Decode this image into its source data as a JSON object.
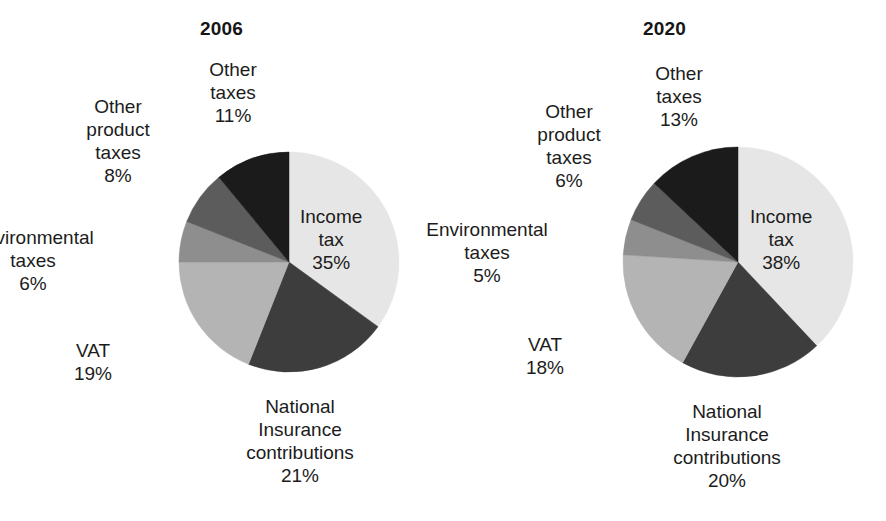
{
  "figure": {
    "background": "#ffffff",
    "text_color": "#1c1c1c"
  },
  "palette": {
    "income_tax": "#e6e6e6",
    "national_insurance": "#3d3d3d",
    "vat": "#b4b4b4",
    "environmental_taxes": "#8e8e8e",
    "other_product_taxes": "#5c5c5c",
    "other_taxes": "#1b1b1b"
  },
  "charts": [
    {
      "id": "pie-2006",
      "title": "2006",
      "center": {
        "x": 289,
        "y": 262
      },
      "radius": 110,
      "start_angle_deg": 0,
      "direction": "clockwise",
      "slices": [
        {
          "key": "income_tax",
          "name": "Income tax",
          "value": 35,
          "value_label": "35%",
          "color": "#e6e6e6",
          "label_lines": [
            "Income",
            "tax",
            "35%"
          ],
          "label_x": 300,
          "label_y": 205,
          "label_align": "left",
          "placement": "inside"
        },
        {
          "key": "national_insurance",
          "name": "National Insurance contributions",
          "value": 21,
          "value_label": "21%",
          "color": "#3d3d3d",
          "label_lines": [
            "National",
            "Insurance",
            "contributions",
            "21%"
          ],
          "label_x": 300,
          "label_y": 395,
          "label_align": "center",
          "placement": "outside"
        },
        {
          "key": "vat",
          "name": "VAT",
          "value": 19,
          "value_label": "19%",
          "color": "#b4b4b4",
          "label_lines": [
            "VAT",
            "19%"
          ],
          "label_x": 93,
          "label_y": 339,
          "label_align": "center",
          "placement": "outside"
        },
        {
          "key": "environmental_taxes",
          "name": "Environmental taxes",
          "value": 6,
          "value_label": "6%",
          "color": "#8e8e8e",
          "label_lines": [
            "Environmental",
            "taxes",
            "6%"
          ],
          "label_x": 33,
          "label_y": 226,
          "label_align": "center",
          "placement": "outside"
        },
        {
          "key": "other_product_taxes",
          "name": "Other product taxes",
          "value": 8,
          "value_label": "8%",
          "color": "#5c5c5c",
          "label_lines": [
            "Other",
            "product",
            "taxes",
            "8%"
          ],
          "label_x": 118,
          "label_y": 95,
          "label_align": "center",
          "placement": "outside"
        },
        {
          "key": "other_taxes",
          "name": "Other taxes",
          "value": 11,
          "value_label": "11%",
          "color": "#1b1b1b",
          "label_lines": [
            "Other",
            "taxes",
            "11%"
          ],
          "label_x": 233,
          "label_y": 58,
          "label_align": "center",
          "placement": "outside"
        }
      ]
    },
    {
      "id": "pie-2020",
      "title": "2020",
      "center": {
        "x": 738,
        "y": 262
      },
      "radius": 115,
      "start_angle_deg": 0,
      "direction": "clockwise",
      "slices": [
        {
          "key": "income_tax",
          "name": "Income tax",
          "value": 38,
          "value_label": "38%",
          "color": "#e6e6e6",
          "label_lines": [
            "Income",
            "tax",
            "38%"
          ],
          "label_x": 750,
          "label_y": 205,
          "label_align": "left",
          "placement": "inside"
        },
        {
          "key": "national_insurance",
          "name": "National Insurance contributions",
          "value": 20,
          "value_label": "20%",
          "color": "#3d3d3d",
          "label_lines": [
            "National",
            "Insurance",
            "contributions",
            "20%"
          ],
          "label_x": 727,
          "label_y": 400,
          "label_align": "center",
          "placement": "outside"
        },
        {
          "key": "vat",
          "name": "VAT",
          "value": 18,
          "value_label": "18%",
          "color": "#b4b4b4",
          "label_lines": [
            "VAT",
            "18%"
          ],
          "label_x": 545,
          "label_y": 333,
          "label_align": "center",
          "placement": "outside"
        },
        {
          "key": "environmental_taxes",
          "name": "Environmental taxes",
          "value": 5,
          "value_label": "5%",
          "color": "#8e8e8e",
          "label_lines": [
            "Environmental",
            "taxes",
            "5%"
          ],
          "label_x": 487,
          "label_y": 218,
          "label_align": "center",
          "placement": "outside"
        },
        {
          "key": "other_product_taxes",
          "name": "Other product taxes",
          "value": 6,
          "value_label": "6%",
          "color": "#5c5c5c",
          "label_lines": [
            "Other",
            "product",
            "taxes",
            "6%"
          ],
          "label_x": 569,
          "label_y": 100,
          "label_align": "center",
          "placement": "outside"
        },
        {
          "key": "other_taxes",
          "name": "Other taxes",
          "value": 13,
          "value_label": "13%",
          "color": "#1b1b1b",
          "label_lines": [
            "Other",
            "taxes",
            "13%"
          ],
          "label_x": 679,
          "label_y": 62,
          "label_align": "center",
          "placement": "outside"
        }
      ]
    }
  ],
  "chart_data": [
    {
      "type": "pie",
      "title": "2006",
      "xlabel": "",
      "ylabel": "",
      "categories": [
        "Income tax",
        "National Insurance contributions",
        "VAT",
        "Environmental taxes",
        "Other product taxes",
        "Other taxes"
      ],
      "values": [
        35,
        21,
        19,
        6,
        8,
        11
      ],
      "value_labels": [
        "35%",
        "21%",
        "19%",
        "6%",
        "8%",
        "11%"
      ],
      "units": "percent",
      "total": 100,
      "colors": [
        "#e6e6e6",
        "#3d3d3d",
        "#b4b4b4",
        "#8e8e8e",
        "#5c5c5c",
        "#1b1b1b"
      ],
      "start_angle_deg": 0,
      "direction": "clockwise",
      "legend": "none",
      "grid": false,
      "annotations": []
    },
    {
      "type": "pie",
      "title": "2020",
      "xlabel": "",
      "ylabel": "",
      "categories": [
        "Income tax",
        "National Insurance contributions",
        "VAT",
        "Environmental taxes",
        "Other product taxes",
        "Other taxes"
      ],
      "values": [
        38,
        20,
        18,
        5,
        6,
        13
      ],
      "value_labels": [
        "38%",
        "20%",
        "18%",
        "5%",
        "6%",
        "13%"
      ],
      "units": "percent",
      "total": 100,
      "colors": [
        "#e6e6e6",
        "#3d3d3d",
        "#b4b4b4",
        "#8e8e8e",
        "#5c5c5c",
        "#1b1b1b"
      ],
      "start_angle_deg": 0,
      "direction": "clockwise",
      "legend": "none",
      "grid": false,
      "annotations": []
    }
  ]
}
